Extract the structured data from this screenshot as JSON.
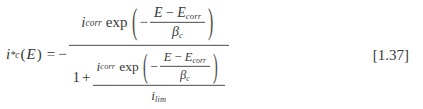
{
  "document": {
    "type": "equation",
    "background_color": "#ffffff",
    "text_color": "#3a3a3a",
    "rule_color": "#4a4a4a"
  },
  "equation": {
    "number": "[1.37]",
    "plain_text": "i*_c(E) = - [ i_corr exp(-(E - E_corr)/beta_c) ] / [ 1 + ( i_corr exp(-(E - E_corr)/beta_c) ) / i_lim ]",
    "lhs": {
      "variable": "i",
      "prime": "*",
      "subscript": "c",
      "open_paren": "(",
      "argument": "E",
      "close_paren": ")"
    },
    "equals": "=",
    "leading_minus": "−",
    "numerator": {
      "coefficient": {
        "symbol": "i",
        "subscript": "corr"
      },
      "function": "exp",
      "open_delim": "(",
      "close_delim": ")",
      "arg_sign": "−",
      "arg_numerator_left": "E",
      "arg_numerator_op": "−",
      "arg_numerator_right": {
        "symbol": "E",
        "subscript": "corr"
      },
      "arg_denominator": {
        "symbol": "β",
        "subscript": "c"
      }
    },
    "denominator": {
      "one": "1",
      "plus": "+",
      "fraction": {
        "numerator": {
          "coefficient": {
            "symbol": "i",
            "subscript": "corr"
          },
          "function": "exp",
          "open_delim": "(",
          "close_delim": ")",
          "arg_sign": "−",
          "arg_numerator_left": "E",
          "arg_numerator_op": "−",
          "arg_numerator_right": {
            "symbol": "E",
            "subscript": "corr"
          },
          "arg_denominator": {
            "symbol": "β",
            "subscript": "c"
          }
        },
        "denominator": {
          "symbol": "i",
          "subscript": "lim"
        }
      }
    }
  }
}
